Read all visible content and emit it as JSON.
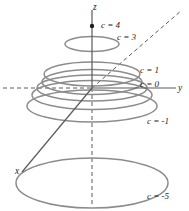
{
  "figure": {
    "background_color": "#ffffff",
    "curve_color": "#8c8c8c",
    "axis_color": "#5a5a5a",
    "text_color": "#1d1d1d",
    "width": 189,
    "height": 211
  },
  "axes": {
    "z": {
      "label": "z",
      "x": 93,
      "y": 3
    },
    "y": {
      "label": "y",
      "x": 178,
      "y": 84
    },
    "x": {
      "label": "x",
      "x": 15,
      "y": 167
    }
  },
  "marker": {
    "name": "vertex-point",
    "label": "c = 4",
    "cx": 92,
    "cy": 26,
    "r": 2.2
  },
  "contours": [
    {
      "c": 4,
      "label": "c = 4",
      "cx": 92,
      "cy": 26,
      "rx": 0,
      "ry": 0,
      "label_x": 101,
      "label_y": 21
    },
    {
      "c": 3,
      "label": "c = 3",
      "cx": 92,
      "cy": 44,
      "rx": 27,
      "ry": 7.5,
      "label_x": 117,
      "label_y": 33
    },
    {
      "c": 1,
      "label": "c = 1",
      "cx": 92,
      "cy": 74,
      "rx": 48,
      "ry": 12,
      "label_x": 140,
      "label_y": 66
    },
    {
      "c": 0,
      "label": "c = 0",
      "cx": 92,
      "cy": 88,
      "rx": 55,
      "ry": 13,
      "label_x": 140,
      "label_y": 80
    },
    {
      "c": -1,
      "label": "c = -1",
      "cx": 92,
      "cy": 106,
      "rx": 65,
      "ry": 16,
      "label_x": 147,
      "label_y": 117
    },
    {
      "c": -5,
      "label": "c = -5",
      "cx": 92,
      "cy": 183,
      "rx": 76,
      "ry": 25,
      "label_x": 147,
      "label_y": 192
    }
  ],
  "extra_contours": [
    {
      "cx": 92,
      "cy": 82,
      "rx": 50,
      "ry": 12.5
    },
    {
      "cx": 92,
      "cy": 95,
      "rx": 60,
      "ry": 14.5
    }
  ],
  "dashed_lines": [
    {
      "name": "y-axis-negative-dashed",
      "x1": 3,
      "y1": 88,
      "x2": 92,
      "y2": 88
    },
    {
      "name": "z-axis-lower-dashed",
      "x1": 92,
      "y1": 88,
      "x2": 92,
      "y2": 207
    },
    {
      "name": "x-axis-negative-dashed",
      "x1": 92,
      "y1": 88,
      "x2": 182,
      "y2": 10
    }
  ],
  "solid_lines": [
    {
      "name": "z-axis-positive",
      "x1": 92,
      "y1": 10,
      "x2": 92,
      "y2": 88
    },
    {
      "name": "y-axis-positive",
      "x1": 92,
      "y1": 88,
      "x2": 176,
      "y2": 88
    },
    {
      "name": "x-axis-positive",
      "x1": 92,
      "y1": 88,
      "x2": 22,
      "y2": 172
    }
  ]
}
